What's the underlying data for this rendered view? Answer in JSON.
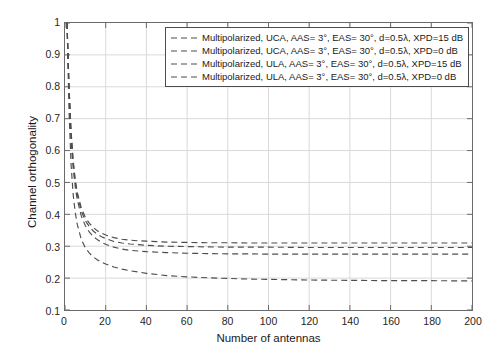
{
  "chart_data": {
    "type": "line",
    "title": "",
    "xlabel": "Number of antennas",
    "ylabel": "Channel orthogonality",
    "xlim": [
      0,
      200
    ],
    "ylim": [
      0.1,
      1
    ],
    "xticks": [
      0,
      20,
      40,
      60,
      80,
      100,
      120,
      140,
      160,
      180,
      200
    ],
    "yticks": [
      "0.1",
      "0.2",
      "0.3",
      "0.4",
      "0.5",
      "0.6",
      "0.7",
      "0.8",
      "0.9",
      "1"
    ],
    "grid": true,
    "legend_position": "top-center-inside",
    "line_style": "dashed",
    "line_color": "#4d4d4d",
    "series": [
      {
        "name": "Multipolarized, UCA, AAS= 3°, EAS= 30°, d=0.5λ, XPD=15 dB",
        "x": [
          1,
          2,
          3,
          4,
          5,
          6,
          8,
          10,
          12,
          14,
          16,
          18,
          20,
          24,
          28,
          32,
          36,
          40,
          50,
          60,
          70,
          80,
          90,
          100,
          120,
          140,
          160,
          180,
          200
        ],
        "y": [
          1.0,
          0.8,
          0.66,
          0.57,
          0.51,
          0.47,
          0.42,
          0.39,
          0.372,
          0.358,
          0.348,
          0.341,
          0.335,
          0.327,
          0.322,
          0.319,
          0.317,
          0.316,
          0.313,
          0.312,
          0.311,
          0.311,
          0.31,
          0.31,
          0.31,
          0.31,
          0.31,
          0.31,
          0.31
        ]
      },
      {
        "name": "Multipolarized, UCA, AAS= 3°, EAS= 30°, d=0.5λ, XPD=0 dB",
        "x": [
          1,
          2,
          3,
          4,
          5,
          6,
          8,
          10,
          12,
          14,
          16,
          18,
          20,
          24,
          28,
          32,
          36,
          40,
          50,
          60,
          70,
          80,
          90,
          100,
          120,
          140,
          160,
          180,
          200
        ],
        "y": [
          1.0,
          0.78,
          0.63,
          0.545,
          0.487,
          0.447,
          0.395,
          0.364,
          0.344,
          0.33,
          0.32,
          0.312,
          0.306,
          0.297,
          0.291,
          0.287,
          0.285,
          0.283,
          0.28,
          0.278,
          0.277,
          0.276,
          0.276,
          0.275,
          0.275,
          0.275,
          0.275,
          0.275,
          0.275
        ]
      },
      {
        "name": "Multipolarized, ULA, AAS= 3°, EAS= 30°, d=0.5λ, XPD=15 dB",
        "x": [
          1,
          2,
          3,
          4,
          5,
          6,
          8,
          10,
          12,
          14,
          16,
          18,
          20,
          24,
          28,
          32,
          36,
          40,
          50,
          60,
          70,
          80,
          90,
          100,
          120,
          140,
          160,
          180,
          200
        ],
        "y": [
          1.0,
          0.795,
          0.655,
          0.565,
          0.505,
          0.463,
          0.41,
          0.38,
          0.361,
          0.347,
          0.337,
          0.33,
          0.324,
          0.315,
          0.31,
          0.307,
          0.305,
          0.303,
          0.3,
          0.299,
          0.298,
          0.297,
          0.297,
          0.297,
          0.296,
          0.296,
          0.296,
          0.296,
          0.296
        ]
      },
      {
        "name": "Multipolarized, ULA, AAS= 3°, EAS= 30°, d=0.5λ, XPD=0 dB",
        "x": [
          1,
          2,
          3,
          4,
          5,
          6,
          8,
          10,
          12,
          14,
          16,
          18,
          20,
          24,
          28,
          32,
          36,
          40,
          50,
          60,
          70,
          80,
          90,
          100,
          120,
          140,
          160,
          180,
          200
        ],
        "y": [
          1.0,
          0.72,
          0.555,
          0.463,
          0.407,
          0.369,
          0.322,
          0.295,
          0.278,
          0.266,
          0.257,
          0.25,
          0.244,
          0.235,
          0.228,
          0.223,
          0.219,
          0.215,
          0.208,
          0.204,
          0.201,
          0.199,
          0.197,
          0.196,
          0.194,
          0.193,
          0.192,
          0.192,
          0.191
        ]
      }
    ]
  },
  "legend": {
    "items": [
      {
        "label": "Multipolarized, UCA, AAS= 3°, EAS= 30°, d=0.5λ, XPD=15 dB"
      },
      {
        "label": "Multipolarized, UCA, AAS= 3°, EAS= 30°, d=0.5λ, XPD=0 dB"
      },
      {
        "label": "Multipolarized, ULA, AAS= 3°, EAS= 30°, d=0.5λ, XPD=15 dB"
      },
      {
        "label": "Multipolarized, ULA, AAS= 3°, EAS= 30°, d=0.5λ, XPD=0 dB"
      }
    ]
  },
  "axes": {
    "x_title": "Number of antennas",
    "y_title": "Channel orthogonality"
  },
  "colors": {
    "line": "#4d4d4d",
    "grid": "#d9d9d9",
    "axis": "#6b6b6b",
    "text": "#1a1a1a",
    "background": "#ffffff"
  }
}
